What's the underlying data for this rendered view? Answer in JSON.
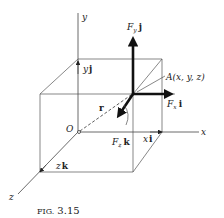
{
  "figure": {
    "caption_prefix": "FIG.",
    "caption_number": "3.15"
  },
  "axes": {
    "x_label": "x",
    "y_label": "y",
    "z_label": "z",
    "origin_label": "O"
  },
  "vectors": {
    "position_label": "r",
    "point_label": "A(x, y, z)",
    "fx": {
      "sym": "F",
      "sub": "x",
      "unit": "i"
    },
    "fy": {
      "sym": "F",
      "sub": "y",
      "unit": "j"
    },
    "fz": {
      "sym": "F",
      "sub": "z",
      "unit": "k"
    },
    "xi": {
      "sym": "x",
      "unit": "i"
    },
    "yj": {
      "sym": "y",
      "unit": "j"
    },
    "zk": {
      "sym": "z",
      "unit": "k"
    }
  }
}
